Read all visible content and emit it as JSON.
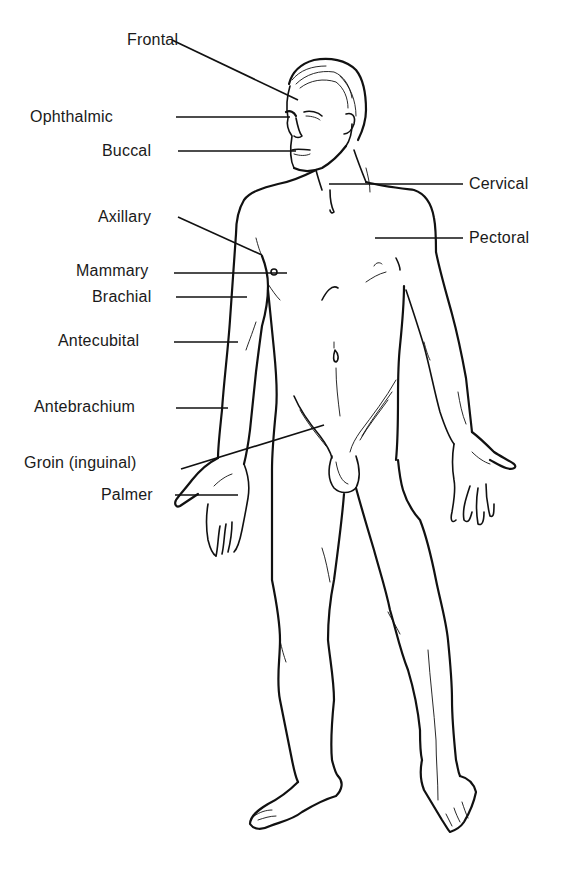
{
  "diagram": {
    "colors": {
      "ink": "#111111",
      "background": "#ffffff"
    },
    "labels": [
      {
        "id": "frontal",
        "text": "Frontal",
        "side": "left",
        "x": 127,
        "y": 32
      },
      {
        "id": "ophthalmic",
        "text": "Ophthalmic",
        "side": "left",
        "x": 30,
        "y": 109
      },
      {
        "id": "buccal",
        "text": "Buccal",
        "side": "left",
        "x": 102,
        "y": 143
      },
      {
        "id": "cervical",
        "text": "Cervical",
        "side": "right",
        "x": 469,
        "y": 176
      },
      {
        "id": "pectoral",
        "text": "Pectoral",
        "side": "right",
        "x": 469,
        "y": 230
      },
      {
        "id": "axillary",
        "text": "Axillary",
        "side": "left",
        "x": 98,
        "y": 209
      },
      {
        "id": "mammary",
        "text": "Mammary",
        "side": "left",
        "x": 76,
        "y": 263
      },
      {
        "id": "brachial",
        "text": "Brachial",
        "side": "left",
        "x": 92,
        "y": 289
      },
      {
        "id": "antecubital",
        "text": "Antecubital",
        "side": "left",
        "x": 58,
        "y": 333
      },
      {
        "id": "antebrachium",
        "text": "Antebrachium",
        "side": "left",
        "x": 34,
        "y": 399
      },
      {
        "id": "groin",
        "text": "Groin (inguinal)",
        "side": "left",
        "x": 24,
        "y": 455
      },
      {
        "id": "palmer",
        "text": "Palmer",
        "side": "left",
        "x": 101,
        "y": 487
      }
    ],
    "leader_lines": [
      {
        "id": "frontal",
        "x1": 172,
        "y1": 40,
        "x2": 298,
        "y2": 100
      },
      {
        "id": "ophthalmic",
        "x1": 176,
        "y1": 117,
        "x2": 290,
        "y2": 117
      },
      {
        "id": "buccal",
        "x1": 178,
        "y1": 151,
        "x2": 296,
        "y2": 151
      },
      {
        "id": "cervical",
        "x1": 329,
        "y1": 184,
        "x2": 463,
        "y2": 184
      },
      {
        "id": "pectoral",
        "x1": 375,
        "y1": 238,
        "x2": 463,
        "y2": 238
      },
      {
        "id": "axillary",
        "x1": 178,
        "y1": 217,
        "x2": 262,
        "y2": 255
      },
      {
        "id": "mammary",
        "x1": 174,
        "y1": 273,
        "x2": 287,
        "y2": 273
      },
      {
        "id": "brachial",
        "x1": 176,
        "y1": 297,
        "x2": 247,
        "y2": 297
      },
      {
        "id": "antecubital",
        "x1": 174,
        "y1": 342,
        "x2": 238,
        "y2": 342
      },
      {
        "id": "antebrachium",
        "x1": 176,
        "y1": 408,
        "x2": 228,
        "y2": 408
      },
      {
        "id": "groin",
        "x1": 181,
        "y1": 469,
        "x2": 324,
        "y2": 425
      },
      {
        "id": "palmer",
        "x1": 175,
        "y1": 495,
        "x2": 238,
        "y2": 495
      }
    ]
  }
}
